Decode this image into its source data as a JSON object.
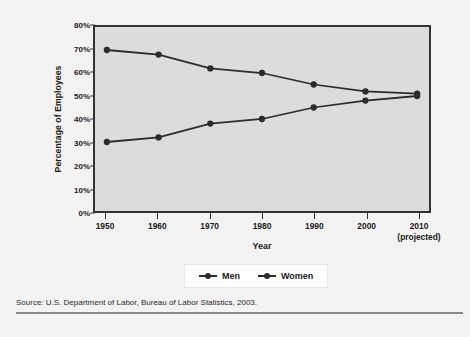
{
  "figure": {
    "source_note": "Source: U.S. Department of Labor, Bureau of Labor Statistics, 2003."
  },
  "axes": {
    "y_title": "Percentage of Employees",
    "x_title": "Year",
    "y_tick_labels": [
      "80%",
      "70%",
      "60%",
      "50%",
      "40%",
      "30%",
      "20%",
      "10%",
      "0%"
    ],
    "x_tick_labels": [
      "1950",
      "1960",
      "1970",
      "1980",
      "1990",
      "2000",
      "2010"
    ],
    "x_tick_sublabel": "(projected)"
  },
  "legend": {
    "position": "bottom-center",
    "entries": [
      {
        "label": "Men",
        "symbol": "line-marker",
        "color": "#2b2b2b"
      },
      {
        "label": "Women",
        "symbol": "line-marker",
        "color": "#2b2b2b"
      }
    ]
  },
  "colors": {
    "plot_background": "#dcdcdc",
    "frame": "#333333",
    "series": "#2b2b2b",
    "card_background": "#f3f3f3",
    "rule": "#8a8a8a"
  },
  "chart_data": {
    "type": "line",
    "title": "",
    "subtitle": "",
    "xlabel": "Year",
    "ylabel": "Percentage of Employees",
    "categories": [
      "1950",
      "1960",
      "1970",
      "1980",
      "1990",
      "2000",
      "2010"
    ],
    "x": [
      1950,
      1960,
      1970,
      1980,
      1990,
      2000,
      2010
    ],
    "series": [
      {
        "name": "Men",
        "values": [
          70,
          68,
          62,
          60,
          55,
          52,
          51
        ],
        "color": "#2b2b2b",
        "marker": "circle"
      },
      {
        "name": "Women",
        "values": [
          30,
          32,
          38,
          40,
          45,
          48,
          50
        ],
        "color": "#2b2b2b",
        "marker": "circle"
      }
    ],
    "ylim": [
      0,
      80
    ],
    "ytick_step": 10,
    "ytick_format": "percent",
    "xlim": [
      1945,
      2015
    ],
    "grid": false,
    "legend_position": "bottom-center",
    "annotations": [
      "2010 values are projected"
    ],
    "source": "Source: U.S. Department of Labor, Bureau of Labor Statistics, 2003."
  }
}
